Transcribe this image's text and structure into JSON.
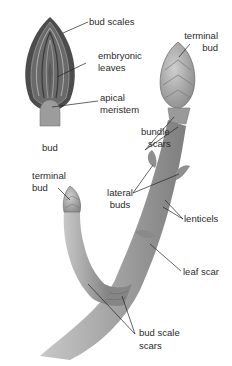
{
  "diagram": {
    "bud_section": {
      "caption": "bud",
      "labels": {
        "bud_scales": "bud scales",
        "embryonic_leaves_1": "embryonic",
        "embryonic_leaves_2": "leaves",
        "apical_meristem_1": "apical",
        "apical_meristem_2": "meristem"
      }
    },
    "twig": {
      "labels": {
        "terminal_bud_top_1": "terminal",
        "terminal_bud_top_2": "bud",
        "bundle_scars_1": "bundle",
        "bundle_scars_2": "scars",
        "terminal_bud_left_1": "terminal",
        "terminal_bud_left_2": "bud",
        "lateral_buds_1": "lateral",
        "lateral_buds_2": "buds",
        "lenticels": "lenticels",
        "leaf_scar": "leaf scar",
        "bud_scale_scars_1": "bud scale",
        "bud_scale_scars_2": "scars"
      }
    },
    "colors": {
      "background": "#ffffff",
      "text": "#2a2a2a",
      "leader": "#222222",
      "bud_dark": "#4a4a4a",
      "bud_mid": "#7a7a7a",
      "twig": "#a8a8a8",
      "twig_shadow": "#7c7c7c"
    }
  }
}
